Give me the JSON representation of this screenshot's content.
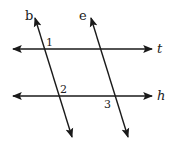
{
  "diagram": {
    "type": "parallel-lines-transversals",
    "colors": {
      "line": "#1a1a1a",
      "background": "#ffffff"
    },
    "lines": [
      {
        "name": "t",
        "orientation": "horizontal"
      },
      {
        "name": "h",
        "orientation": "horizontal"
      },
      {
        "name": "b",
        "orientation": "transversal"
      },
      {
        "name": "e",
        "orientation": "transversal"
      }
    ],
    "labels": {
      "b": "b",
      "e": "e",
      "t": "t",
      "h": "h"
    },
    "angles": {
      "a1": "1",
      "a2": "2",
      "a3": "3"
    }
  }
}
